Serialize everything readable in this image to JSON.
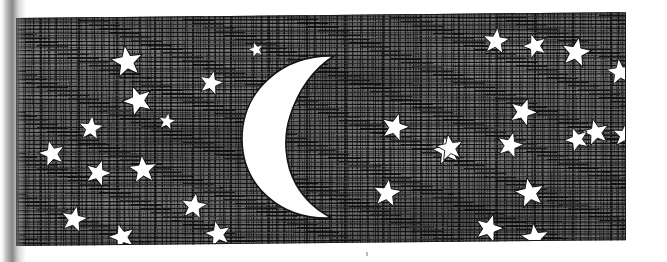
{
  "artwork": {
    "title": "Night Sky with Crescent Moon and Stars",
    "medium": "pen-and-ink hatched illustration",
    "caption": "",
    "background_color": "#ffffff",
    "ink_color": "#111111",
    "sky_tone": "#6b6b6b",
    "highlight_color": "#ffffff"
  },
  "plate": {
    "name": "sky-panel",
    "left": 16,
    "top": 18,
    "width": 610,
    "height": 228,
    "border_color": "#1a1a1a",
    "skew_deg": -0.55
  },
  "gutter": {
    "name": "page-gutter-shadow",
    "side": "left",
    "width": 26,
    "color": "#6e6e6e"
  },
  "moon": {
    "name": "crescent-moon",
    "phase": "waxing crescent",
    "opens_toward": "right",
    "left": 222,
    "top": 35,
    "width": 120,
    "height": 172,
    "fill": "#ffffff",
    "outline": "#141414"
  },
  "stars": [
    {
      "id": 1,
      "x": 94,
      "y": 28,
      "size": 34,
      "rot": -8,
      "fill": "#ffffff"
    },
    {
      "id": 2,
      "x": 182,
      "y": 54,
      "size": 26,
      "rot": 14,
      "fill": "#ffffff"
    },
    {
      "id": 3,
      "x": 106,
      "y": 68,
      "size": 32,
      "rot": -20,
      "fill": "#ffffff"
    },
    {
      "id": 4,
      "x": 62,
      "y": 98,
      "size": 26,
      "rot": 6,
      "fill": "#ffffff"
    },
    {
      "id": 5,
      "x": 22,
      "y": 122,
      "size": 28,
      "rot": -14,
      "fill": "#ffffff"
    },
    {
      "id": 6,
      "x": 68,
      "y": 142,
      "size": 28,
      "rot": 18,
      "fill": "#ffffff"
    },
    {
      "id": 7,
      "x": 112,
      "y": 138,
      "size": 30,
      "rot": -5,
      "fill": "#ffffff"
    },
    {
      "id": 8,
      "x": 44,
      "y": 188,
      "size": 28,
      "rot": 12,
      "fill": "#ffffff"
    },
    {
      "id": 9,
      "x": 92,
      "y": 206,
      "size": 28,
      "rot": -16,
      "fill": "#ffffff"
    },
    {
      "id": 10,
      "x": 164,
      "y": 176,
      "size": 28,
      "rot": 9,
      "fill": "#ffffff"
    },
    {
      "id": 11,
      "x": 188,
      "y": 204,
      "size": 28,
      "rot": -12,
      "fill": "#ffffff"
    },
    {
      "id": 12,
      "x": 364,
      "y": 98,
      "size": 30,
      "rot": 16,
      "fill": "#ffffff"
    },
    {
      "id": 13,
      "x": 416,
      "y": 122,
      "size": 30,
      "rot": -10,
      "fill": "#ffffff"
    },
    {
      "id": 14,
      "x": 466,
      "y": 14,
      "size": 28,
      "rot": 7,
      "fill": "#ffffff"
    },
    {
      "id": 15,
      "x": 506,
      "y": 20,
      "size": 26,
      "rot": -18,
      "fill": "#ffffff"
    },
    {
      "id": 16,
      "x": 544,
      "y": 24,
      "size": 32,
      "rot": 11,
      "fill": "#ffffff"
    },
    {
      "id": 17,
      "x": 590,
      "y": 46,
      "size": 28,
      "rot": -6,
      "fill": "#ffffff"
    },
    {
      "id": 18,
      "x": 492,
      "y": 84,
      "size": 30,
      "rot": 20,
      "fill": "#ffffff"
    },
    {
      "id": 19,
      "x": 566,
      "y": 106,
      "size": 28,
      "rot": -13,
      "fill": "#ffffff"
    },
    {
      "id": 20,
      "x": 596,
      "y": 110,
      "size": 26,
      "rot": 5,
      "fill": "#ffffff"
    },
    {
      "id": 21,
      "x": 420,
      "y": 120,
      "size": 28,
      "rot": -9,
      "fill": "#ffffff"
    },
    {
      "id": 22,
      "x": 480,
      "y": 118,
      "size": 28,
      "rot": 15,
      "fill": "#ffffff"
    },
    {
      "id": 23,
      "x": 548,
      "y": 114,
      "size": 26,
      "rot": -21,
      "fill": "#ffffff"
    },
    {
      "id": 24,
      "x": 356,
      "y": 164,
      "size": 30,
      "rot": 8,
      "fill": "#ffffff"
    },
    {
      "id": 25,
      "x": 498,
      "y": 164,
      "size": 32,
      "rot": -11,
      "fill": "#ffffff"
    },
    {
      "id": 26,
      "x": 458,
      "y": 200,
      "size": 30,
      "rot": 17,
      "fill": "#ffffff"
    },
    {
      "id": 27,
      "x": 504,
      "y": 210,
      "size": 30,
      "rot": -7,
      "fill": "#ffffff"
    },
    {
      "id": 28,
      "x": 142,
      "y": 96,
      "size": 18,
      "rot": 10,
      "fill": "#ffffff"
    },
    {
      "id": 29,
      "x": 232,
      "y": 26,
      "size": 16,
      "rot": -15,
      "fill": "#ffffff"
    },
    {
      "id": 30,
      "x": 608,
      "y": 142,
      "size": 16,
      "rot": 22,
      "fill": "#ffffff"
    }
  ],
  "star_count_label": "30"
}
